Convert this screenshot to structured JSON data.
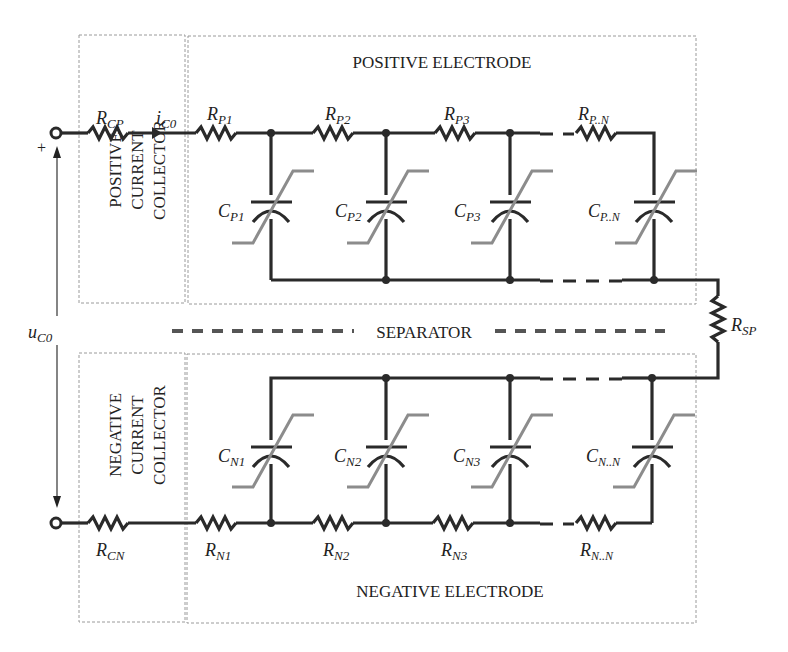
{
  "regions": {
    "positive_electrode": "POSITIVE ELECTRODE",
    "negative_electrode": "NEGATIVE ELECTRODE",
    "separator": "SEPARATOR",
    "positive_collector": [
      "POSITIVE",
      "CURRENT",
      "COLLECTOR"
    ],
    "negative_collector": [
      "NEGATIVE",
      "CURRENT",
      "COLLECTOR"
    ]
  },
  "terminal": {
    "plus": "+",
    "voltage": {
      "main": "u",
      "sub": "C0"
    },
    "current": {
      "main": "i",
      "sub": "C0"
    }
  },
  "positive": {
    "collector_resistor": {
      "main": "R",
      "sub": "CP"
    },
    "resistors": [
      {
        "main": "R",
        "sub": "P1"
      },
      {
        "main": "R",
        "sub": "P2"
      },
      {
        "main": "R",
        "sub": "P3"
      },
      {
        "main": "R",
        "sub": "P..N"
      }
    ],
    "capacitors": [
      {
        "main": "C",
        "sub": "P1"
      },
      {
        "main": "C",
        "sub": "P2"
      },
      {
        "main": "C",
        "sub": "P3"
      },
      {
        "main": "C",
        "sub": "P..N"
      }
    ]
  },
  "separator_resistor": {
    "main": "R",
    "sub": "SP"
  },
  "negative": {
    "collector_resistor": {
      "main": "R",
      "sub": "CN"
    },
    "resistors": [
      {
        "main": "R",
        "sub": "N1"
      },
      {
        "main": "R",
        "sub": "N2"
      },
      {
        "main": "R",
        "sub": "N3"
      },
      {
        "main": "R",
        "sub": "N..N"
      }
    ],
    "capacitors": [
      {
        "main": "C",
        "sub": "N1"
      },
      {
        "main": "C",
        "sub": "N2"
      },
      {
        "main": "C",
        "sub": "N3"
      },
      {
        "main": "C",
        "sub": "N..N"
      }
    ]
  },
  "colors": {
    "wire": "#2a2a2a",
    "variable_marker": "#8c8c8c",
    "region_border": "#9a9a9a"
  }
}
